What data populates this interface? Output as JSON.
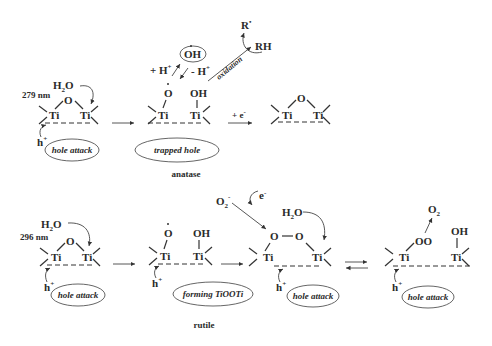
{
  "anatase": {
    "label": "anatase",
    "wavelength": "279 nm",
    "reactant": "H2O",
    "hole": "h+",
    "step1_label": "hole attack",
    "step2_label": "trapped hole",
    "radical": "OH•",
    "plus_h": "+ H+",
    "minus_h": "- H+",
    "oxidation": "oxidation",
    "r_radical": "R•",
    "rh": "RH",
    "electron": "+ e-",
    "o_atom": "O",
    "oh_group": "OH",
    "ti": "Ti"
  },
  "rutile": {
    "label": "rutile",
    "wavelength": "296 nm",
    "reactant": "H2O",
    "hole": "h+",
    "step1_label": "hole attack",
    "step2_label": "forming TiOOTi",
    "step3_label": "hole attack",
    "step4_label": "hole attack",
    "superoxide": "O2-",
    "electron": "e-",
    "oxygen": "O2",
    "peroxo": "O — O",
    "oo": "OO",
    "oh_group": "OH",
    "ti": "Ti"
  }
}
